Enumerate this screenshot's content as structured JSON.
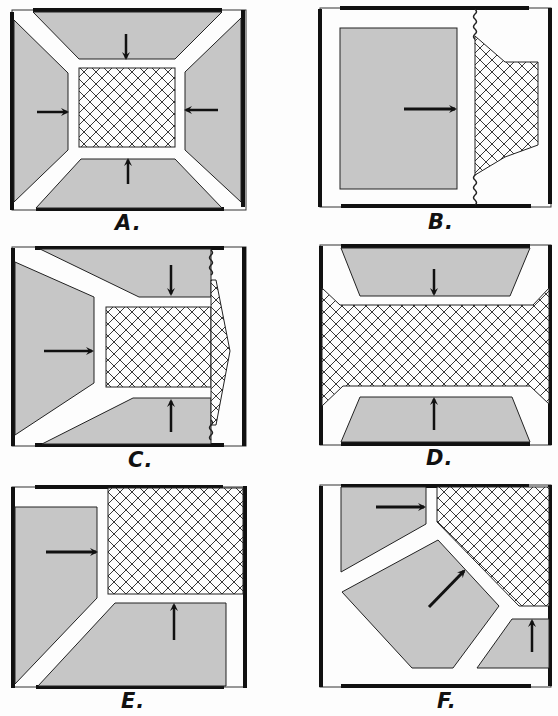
{
  "figure": {
    "colors": {
      "gray_fill": "#c6c6c6",
      "outline": "#111111",
      "background": "#fdfdfd",
      "hatch": "#222222"
    },
    "panels": [
      {
        "id": "A",
        "label": "A."
      },
      {
        "id": "B",
        "label": "B."
      },
      {
        "id": "C",
        "label": "C."
      },
      {
        "id": "D",
        "label": "D."
      },
      {
        "id": "E",
        "label": "E."
      },
      {
        "id": "F",
        "label": "F."
      }
    ],
    "legend_semantics": {
      "gray_region": "solid block",
      "crosshatched_region": "mesh/cellular region",
      "arrow": "direction of pressure/movement",
      "wavy_line": "flexible boundary"
    }
  }
}
